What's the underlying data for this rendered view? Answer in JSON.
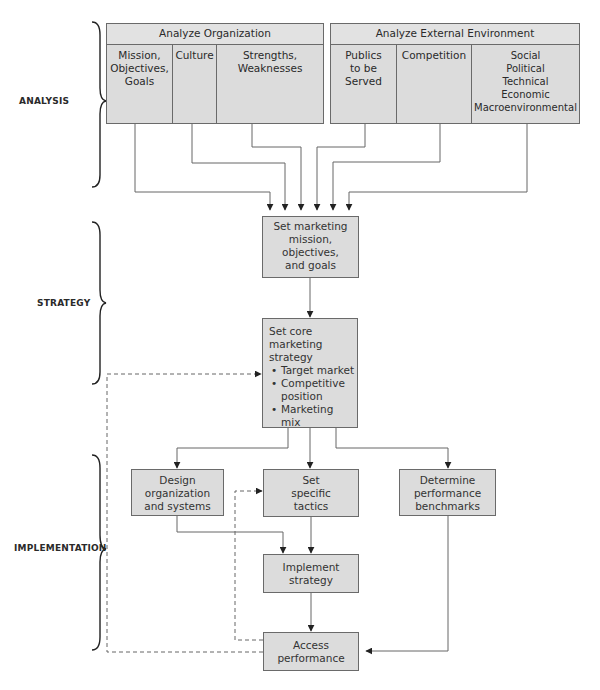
{
  "phases": {
    "analysis": "ANALYSIS",
    "strategy": "STRATEGY",
    "implementation": "IMPLEMENTATION"
  },
  "analyze_organization": {
    "title": "Analyze Organization",
    "columns": [
      "Mission,\nObjectives,\nGoals",
      "Culture",
      "Strengths,\nWeaknesses"
    ]
  },
  "analyze_external": {
    "title": "Analyze External Environment",
    "columns": [
      "Publics\nto be\nServed",
      "Competition",
      "Social\nPolitical\nTechnical\nEconomic\nMacroenvironmental"
    ]
  },
  "set_mission": {
    "label": "Set marketing\nmission,\nobjectives,\nand goals"
  },
  "core_strategy": {
    "title": "Set core\nmarketing\nstrategy",
    "bullets": [
      "Target market",
      "Competitive\nposition",
      "Marketing\nmix"
    ]
  },
  "design_org": {
    "label": "Design\norganization\nand systems"
  },
  "set_tactics": {
    "label": "Set\nspecific\ntactics"
  },
  "benchmarks": {
    "label": "Determine\nperformance\nbenchmarks"
  },
  "implement": {
    "label": "Implement\nstrategy"
  },
  "access": {
    "label": "Access\nperformance"
  },
  "colors": {
    "box_fill": "#dcdcdc",
    "line": "#555555",
    "text": "#333333"
  }
}
